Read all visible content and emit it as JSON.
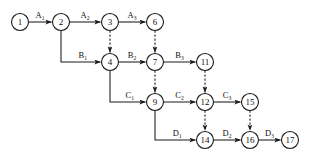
{
  "diagram": {
    "type": "node-link-network",
    "background_color": "#ffffff",
    "line_color": "#1a1a1a",
    "node_fill_color": "#ffffff",
    "node_radius": 8.5,
    "nodes": [
      {
        "id": "n1",
        "label": "1",
        "x": 20,
        "y": 22
      },
      {
        "id": "n2",
        "label": "2",
        "x": 61,
        "y": 22
      },
      {
        "id": "n3",
        "label": "3",
        "x": 110,
        "y": 22
      },
      {
        "id": "n6",
        "label": "6",
        "x": 155,
        "y": 22
      },
      {
        "id": "n4",
        "label": "4",
        "x": 110,
        "y": 62
      },
      {
        "id": "n7",
        "label": "7",
        "x": 155,
        "y": 62
      },
      {
        "id": "n11",
        "label": "11",
        "x": 205,
        "y": 62
      },
      {
        "id": "n9",
        "label": "9",
        "x": 155,
        "y": 102
      },
      {
        "id": "n12",
        "label": "12",
        "x": 205,
        "y": 102
      },
      {
        "id": "n15",
        "label": "15",
        "x": 250,
        "y": 102
      },
      {
        "id": "n14",
        "label": "14",
        "x": 205,
        "y": 140
      },
      {
        "id": "n16",
        "label": "16",
        "x": 250,
        "y": 140
      },
      {
        "id": "n17",
        "label": "17",
        "x": 290,
        "y": 140
      }
    ],
    "edges": [
      {
        "id": "e-a1",
        "from": "n1",
        "to": "n2",
        "style": "solid",
        "shape": "straight",
        "label": "A",
        "sub": "1"
      },
      {
        "id": "e-a2",
        "from": "n2",
        "to": "n3",
        "style": "solid",
        "shape": "straight",
        "label": "A",
        "sub": "2"
      },
      {
        "id": "e-a3",
        "from": "n3",
        "to": "n6",
        "style": "solid",
        "shape": "straight",
        "label": "A",
        "sub": "3"
      },
      {
        "id": "e-b1",
        "from": "n2",
        "to": "n4",
        "style": "solid",
        "shape": "elbow",
        "label": "B",
        "sub": "1"
      },
      {
        "id": "e-b2",
        "from": "n4",
        "to": "n7",
        "style": "solid",
        "shape": "straight",
        "label": "B",
        "sub": "2"
      },
      {
        "id": "e-b3",
        "from": "n7",
        "to": "n11",
        "style": "solid",
        "shape": "straight",
        "label": "B",
        "sub": "3"
      },
      {
        "id": "e-c1",
        "from": "n4",
        "to": "n9",
        "style": "solid",
        "shape": "elbow",
        "label": "C",
        "sub": "1"
      },
      {
        "id": "e-c2",
        "from": "n9",
        "to": "n12",
        "style": "solid",
        "shape": "straight",
        "label": "C",
        "sub": "2"
      },
      {
        "id": "e-c3",
        "from": "n12",
        "to": "n15",
        "style": "solid",
        "shape": "straight",
        "label": "C",
        "sub": "3"
      },
      {
        "id": "e-d1",
        "from": "n9",
        "to": "n14",
        "style": "solid",
        "shape": "elbow",
        "label": "D",
        "sub": "1"
      },
      {
        "id": "e-d2",
        "from": "n14",
        "to": "n16",
        "style": "solid",
        "shape": "straight",
        "label": "D",
        "sub": "2"
      },
      {
        "id": "e-d3",
        "from": "n16",
        "to": "n17",
        "style": "solid",
        "shape": "straight",
        "label": "D",
        "sub": "3"
      },
      {
        "id": "e-dash-3-4",
        "from": "n3",
        "to": "n4",
        "style": "dashed",
        "shape": "vertical",
        "label": "",
        "sub": ""
      },
      {
        "id": "e-dash-6-7",
        "from": "n6",
        "to": "n7",
        "style": "dashed",
        "shape": "vertical",
        "label": "",
        "sub": ""
      },
      {
        "id": "e-dash-7-9",
        "from": "n7",
        "to": "n9",
        "style": "dashed",
        "shape": "vertical",
        "label": "",
        "sub": ""
      },
      {
        "id": "e-dash-11-12",
        "from": "n11",
        "to": "n12",
        "style": "dashed",
        "shape": "vertical",
        "label": "",
        "sub": ""
      },
      {
        "id": "e-dash-12-14",
        "from": "n12",
        "to": "n14",
        "style": "dashed",
        "shape": "vertical",
        "label": "",
        "sub": ""
      },
      {
        "id": "e-dash-15-16",
        "from": "n15",
        "to": "n16",
        "style": "dashed",
        "shape": "vertical",
        "label": "",
        "sub": ""
      }
    ]
  }
}
